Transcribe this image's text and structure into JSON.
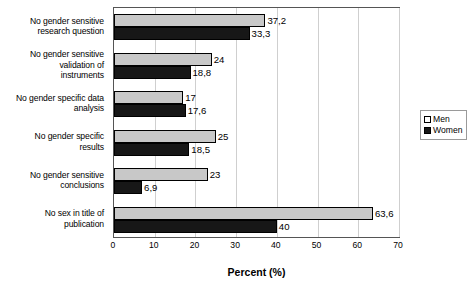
{
  "chart_data": {
    "type": "bar",
    "orientation": "horizontal",
    "title": "",
    "xlabel": "Percent (%)",
    "ylabel": "",
    "xlim": [
      0,
      70
    ],
    "xticks": [
      0,
      10,
      20,
      30,
      40,
      50,
      60,
      70
    ],
    "grid": true,
    "legend_position": "right",
    "decimal_separator": ",",
    "categories": [
      "No gender sensitive research question",
      "No gender sensitive validation of instruments",
      "No gender specific data analysis",
      "No gender specific results",
      "No gender sensitive conclusions",
      "No sex in title of publication"
    ],
    "category_lines": [
      [
        "No gender sensitive",
        "research question"
      ],
      [
        "No gender sensitive",
        "validation of",
        "instruments"
      ],
      [
        "No gender specific data",
        "analysis"
      ],
      [
        "No gender specific",
        "results"
      ],
      [
        "No gender sensitive",
        "conclusions"
      ],
      [
        "No sex in title of",
        "publication"
      ]
    ],
    "series": [
      {
        "name": "Men",
        "color": "#c8c8c8",
        "values": [
          37.2,
          24,
          17,
          25,
          23,
          63.6
        ],
        "labels": [
          "37,2",
          "24",
          "17",
          "25",
          "23",
          "63,6"
        ]
      },
      {
        "name": "Women",
        "color": "#171717",
        "values": [
          33.3,
          18.8,
          17.6,
          18.5,
          6.9,
          40
        ],
        "labels": [
          "33,3",
          "18,8",
          "17,6",
          "18,5",
          "6,9",
          "40"
        ]
      }
    ]
  },
  "legend": {
    "items": [
      {
        "label": "Men",
        "swatch": "men"
      },
      {
        "label": "Women",
        "swatch": "women"
      }
    ]
  },
  "axis": {
    "x_title": "Percent (%)",
    "tick_labels": [
      "0",
      "10",
      "20",
      "30",
      "40",
      "50",
      "60",
      "70"
    ]
  }
}
